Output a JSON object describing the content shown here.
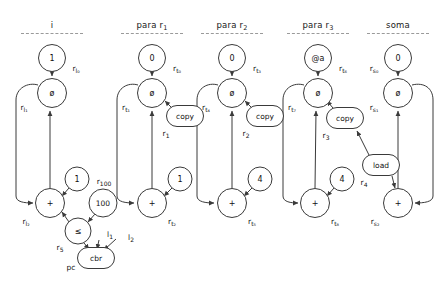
{
  "diagram": {
    "width": 443,
    "height": 283,
    "background": "#ffffff",
    "stroke_color": "#3a3a3a",
    "text_color": "#111111",
    "dash_color": "#9a9a9a"
  },
  "columns": [
    {
      "id": "col-i",
      "label": "i",
      "sub": "",
      "x": 52,
      "header_y": 20,
      "dash_y": 33,
      "dash_w": 62
    },
    {
      "id": "col-para-r1",
      "label": "para r",
      "sub": "1",
      "x": 152,
      "header_y": 20,
      "dash_y": 33,
      "dash_w": 62
    },
    {
      "id": "col-para-r2",
      "label": "para r",
      "sub": "2",
      "x": 232,
      "header_y": 20,
      "dash_y": 33,
      "dash_w": 62
    },
    {
      "id": "col-para-r3",
      "label": "para r",
      "sub": "3",
      "x": 318,
      "header_y": 20,
      "dash_y": 33,
      "dash_w": 62
    },
    {
      "id": "col-soma",
      "label": "soma",
      "sub": "",
      "x": 398,
      "header_y": 20,
      "dash_y": 33,
      "dash_w": 62
    }
  ],
  "nodes": [
    {
      "id": "n-i-const1",
      "name": "node-const-1",
      "text": "1",
      "shape": "circle",
      "x": 52,
      "y": 58,
      "w": 28,
      "h": 28
    },
    {
      "id": "n-i-phi0",
      "name": "node-phi-rl1",
      "text": "ø",
      "shape": "circle",
      "x": 52,
      "y": 93,
      "w": 30,
      "h": 30
    },
    {
      "id": "n-i-plus",
      "name": "node-plus-rl2",
      "text": "+",
      "shape": "circle",
      "x": 50,
      "y": 203,
      "w": 30,
      "h": 30
    },
    {
      "id": "n-i-c1",
      "name": "node-const-1-incr",
      "text": "1",
      "shape": "circle",
      "x": 77,
      "y": 179,
      "w": 25,
      "h": 25
    },
    {
      "id": "n-i-c100",
      "name": "node-const-100",
      "text": "100",
      "shape": "circle",
      "x": 103,
      "y": 203,
      "w": 29,
      "h": 29
    },
    {
      "id": "n-i-le",
      "name": "node-compare-le",
      "text": "≤",
      "shape": "circle",
      "x": 78,
      "y": 231,
      "w": 27,
      "h": 27
    },
    {
      "id": "n-i-cbr",
      "name": "node-cbr",
      "text": "cbr",
      "shape": "pill",
      "x": 96,
      "y": 258,
      "w": 38,
      "h": 22
    },
    {
      "id": "n-r1-const0",
      "name": "node-const-0-rt0",
      "text": "0",
      "shape": "circle",
      "x": 152,
      "y": 58,
      "w": 28,
      "h": 28
    },
    {
      "id": "n-r1-phi",
      "name": "node-phi-rt1",
      "text": "ø",
      "shape": "circle",
      "x": 152,
      "y": 93,
      "w": 30,
      "h": 30
    },
    {
      "id": "n-r1-copy",
      "name": "node-copy-r1",
      "text": "copy",
      "shape": "pill",
      "x": 185,
      "y": 116,
      "w": 38,
      "h": 22
    },
    {
      "id": "n-r1-plus",
      "name": "node-plus-rt2",
      "text": "+",
      "shape": "circle",
      "x": 152,
      "y": 203,
      "w": 30,
      "h": 30
    },
    {
      "id": "n-r1-c1",
      "name": "node-const-1-rt2",
      "text": "1",
      "shape": "circle",
      "x": 180,
      "y": 179,
      "w": 25,
      "h": 25
    },
    {
      "id": "n-r2-const0",
      "name": "node-const-0-rt3",
      "text": "0",
      "shape": "circle",
      "x": 232,
      "y": 58,
      "w": 28,
      "h": 28
    },
    {
      "id": "n-r2-phi",
      "name": "node-phi-rt4",
      "text": "ø",
      "shape": "circle",
      "x": 232,
      "y": 93,
      "w": 30,
      "h": 30
    },
    {
      "id": "n-r2-copy",
      "name": "node-copy-r2",
      "text": "copy",
      "shape": "pill",
      "x": 265,
      "y": 116,
      "w": 38,
      "h": 22
    },
    {
      "id": "n-r2-plus",
      "name": "node-plus-rt5",
      "text": "+",
      "shape": "circle",
      "x": 232,
      "y": 203,
      "w": 30,
      "h": 30
    },
    {
      "id": "n-r2-c4",
      "name": "node-const-4-rt5",
      "text": "4",
      "shape": "circle",
      "x": 260,
      "y": 179,
      "w": 25,
      "h": 25
    },
    {
      "id": "n-r3-consta",
      "name": "node-const-at-a",
      "text": "@a",
      "shape": "circle",
      "x": 318,
      "y": 58,
      "w": 28,
      "h": 28
    },
    {
      "id": "n-r3-phi",
      "name": "node-phi-rt7",
      "text": "ø",
      "shape": "circle",
      "x": 318,
      "y": 93,
      "w": 30,
      "h": 30
    },
    {
      "id": "n-r3-copy",
      "name": "node-copy-r3",
      "text": "copy",
      "shape": "pill",
      "x": 345,
      "y": 118,
      "w": 38,
      "h": 22
    },
    {
      "id": "n-r3-plus",
      "name": "node-plus-rt8",
      "text": "+",
      "shape": "circle",
      "x": 315,
      "y": 203,
      "w": 30,
      "h": 30
    },
    {
      "id": "n-r3-c4",
      "name": "node-const-4-rt8",
      "text": "4",
      "shape": "circle",
      "x": 342,
      "y": 179,
      "w": 25,
      "h": 25
    },
    {
      "id": "n-load",
      "name": "node-load-r4",
      "text": "load",
      "shape": "pill",
      "x": 381,
      "y": 165,
      "w": 38,
      "h": 22
    },
    {
      "id": "n-s-const0",
      "name": "node-const-0-rs0",
      "text": "0",
      "shape": "circle",
      "x": 398,
      "y": 58,
      "w": 28,
      "h": 28
    },
    {
      "id": "n-s-phi",
      "name": "node-phi-rs1",
      "text": "ø",
      "shape": "circle",
      "x": 398,
      "y": 93,
      "w": 30,
      "h": 30
    },
    {
      "id": "n-s-plus",
      "name": "node-plus-rs2",
      "text": "+",
      "shape": "circle",
      "x": 398,
      "y": 203,
      "w": 30,
      "h": 30
    }
  ],
  "labels": [
    {
      "id": "lbl-rl0",
      "name": "label-rl0",
      "base": "r",
      "sub": "l₀",
      "x": 76,
      "y": 68
    },
    {
      "id": "lbl-rl1",
      "name": "label-rl1",
      "base": "r",
      "sub": "l₁",
      "x": 24,
      "y": 107
    },
    {
      "id": "lbl-rl2",
      "name": "label-rl2",
      "base": "r",
      "sub": "l₂",
      "x": 26,
      "y": 221
    },
    {
      "id": "lbl-r100",
      "name": "label-r100",
      "base": "r",
      "sub": "100",
      "x": 104,
      "y": 181
    },
    {
      "id": "lbl-r5",
      "name": "label-r5",
      "base": "r",
      "sub": "5",
      "x": 60,
      "y": 247
    },
    {
      "id": "lbl-l1",
      "name": "label-l1",
      "base": "l",
      "sub": "1",
      "x": 110,
      "y": 234
    },
    {
      "id": "lbl-l2",
      "name": "label-l2",
      "base": "l",
      "sub": "2",
      "x": 131,
      "y": 237
    },
    {
      "id": "lbl-pc",
      "name": "label-pc",
      "base": "pc",
      "sub": "",
      "x": 71,
      "y": 267
    },
    {
      "id": "lbl-rt0",
      "name": "label-rt0",
      "base": "r",
      "sub": "t₀",
      "x": 177,
      "y": 68
    },
    {
      "id": "lbl-rt1",
      "name": "label-rt1",
      "base": "r",
      "sub": "t₁",
      "x": 126,
      "y": 107
    },
    {
      "id": "lbl-r1",
      "name": "label-r1",
      "base": "r",
      "sub": "1",
      "x": 166,
      "y": 133
    },
    {
      "id": "lbl-rt2",
      "name": "label-rt2",
      "base": "r",
      "sub": "t₂",
      "x": 172,
      "y": 221
    },
    {
      "id": "lbl-rt3",
      "name": "label-rt3",
      "base": "r",
      "sub": "t₃",
      "x": 257,
      "y": 68
    },
    {
      "id": "lbl-rt4",
      "name": "label-rt4",
      "base": "r",
      "sub": "t₄",
      "x": 206,
      "y": 107
    },
    {
      "id": "lbl-r2",
      "name": "label-r2",
      "base": "r",
      "sub": "2",
      "x": 246,
      "y": 133
    },
    {
      "id": "lbl-rt5",
      "name": "label-rt5",
      "base": "r",
      "sub": "t₅",
      "x": 252,
      "y": 221
    },
    {
      "id": "lbl-rt6",
      "name": "label-rt6",
      "base": "r",
      "sub": "t₆",
      "x": 343,
      "y": 68
    },
    {
      "id": "lbl-rt7",
      "name": "label-rt7",
      "base": "r",
      "sub": "t₇",
      "x": 292,
      "y": 107
    },
    {
      "id": "lbl-r3",
      "name": "label-r3",
      "base": "r",
      "sub": "3",
      "x": 326,
      "y": 135
    },
    {
      "id": "lbl-rt8",
      "name": "label-rt8",
      "base": "r",
      "sub": "t₈",
      "x": 335,
      "y": 221
    },
    {
      "id": "lbl-r4",
      "name": "label-r4",
      "base": "r",
      "sub": "4",
      "x": 364,
      "y": 182
    },
    {
      "id": "lbl-rs0",
      "name": "label-rs0",
      "base": "r",
      "sub": "s₀",
      "x": 374,
      "y": 68
    },
    {
      "id": "lbl-rs1",
      "name": "label-rs1",
      "base": "r",
      "sub": "s₁",
      "x": 374,
      "y": 107
    },
    {
      "id": "lbl-rs2",
      "name": "label-rs2",
      "base": "r",
      "sub": "s₂",
      "x": 375,
      "y": 221
    }
  ]
}
